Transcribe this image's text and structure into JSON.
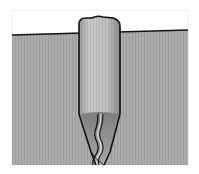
{
  "diagram": {
    "colors": {
      "background": "#ffffff",
      "frame_border": "#eeeeee",
      "fabric": "#a9a9a9",
      "fabric_stripe": "#9a9a9a",
      "tuck_light": "#c4c4c4",
      "tuck_shadow": "#8e8e8e",
      "outline": "#111111"
    }
  }
}
